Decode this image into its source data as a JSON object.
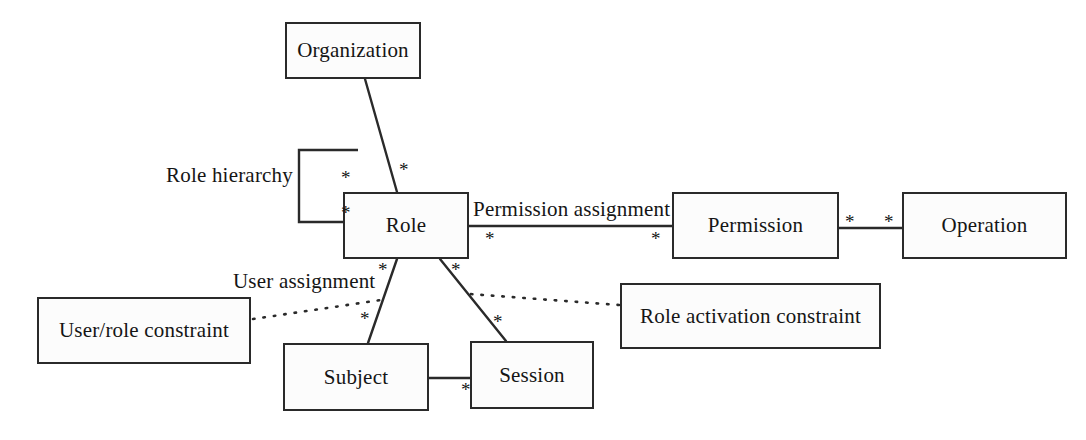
{
  "diagram": {
    "background_color": "#ffffff",
    "stroke_color": "#2a2a2a",
    "text_color": "#151515",
    "box_fill": "#fcfcfc",
    "nodes": [
      {
        "id": "organization",
        "label": "Organization",
        "x": 285,
        "y": 22,
        "w": 136,
        "h": 57
      },
      {
        "id": "role",
        "label": "Role",
        "x": 343,
        "y": 192,
        "w": 126,
        "h": 67
      },
      {
        "id": "permission",
        "label": "Permission",
        "x": 672,
        "y": 192,
        "w": 167,
        "h": 67
      },
      {
        "id": "operation",
        "label": "Operation",
        "x": 902,
        "y": 192,
        "w": 165,
        "h": 67
      },
      {
        "id": "user-role-constraint",
        "label": "User/role constraint",
        "x": 37,
        "y": 297,
        "w": 214,
        "h": 67
      },
      {
        "id": "role-activation-constraint",
        "label": "Role activation constraint",
        "x": 620,
        "y": 283,
        "w": 261,
        "h": 66
      },
      {
        "id": "subject",
        "label": "Subject",
        "x": 283,
        "y": 343,
        "w": 146,
        "h": 68
      },
      {
        "id": "session",
        "label": "Session",
        "x": 470,
        "y": 341,
        "w": 124,
        "h": 68
      }
    ],
    "edge_labels": [
      {
        "id": "role-hierarchy-label",
        "text": "Role hierarchy",
        "x": 166,
        "y": 163
      },
      {
        "id": "permission-assignment-label",
        "text": "Permission assignment",
        "x": 473,
        "y": 197
      },
      {
        "id": "user-assignment-label",
        "text": "User assignment",
        "x": 233,
        "y": 269
      }
    ],
    "multiplicities": [
      {
        "id": "mult-org-role",
        "text": "*",
        "x": 399,
        "y": 160
      },
      {
        "id": "mult-hierarchy-top",
        "text": "*",
        "x": 341,
        "y": 168
      },
      {
        "id": "mult-hierarchy-bottom",
        "text": "*",
        "x": 341,
        "y": 203
      },
      {
        "id": "mult-perm-left",
        "text": "*",
        "x": 485,
        "y": 229
      },
      {
        "id": "mult-perm-right",
        "text": "*",
        "x": 651,
        "y": 229
      },
      {
        "id": "mult-permission-op-left",
        "text": "*",
        "x": 845,
        "y": 212
      },
      {
        "id": "mult-permission-op-right",
        "text": "*",
        "x": 884,
        "y": 212
      },
      {
        "id": "mult-role-subject-top",
        "text": "*",
        "x": 378,
        "y": 260
      },
      {
        "id": "mult-role-subject-bottom",
        "text": "*",
        "x": 360,
        "y": 309
      },
      {
        "id": "mult-role-session-top",
        "text": "*",
        "x": 451,
        "y": 260
      },
      {
        "id": "mult-role-session-bottom",
        "text": "*",
        "x": 493,
        "y": 312
      },
      {
        "id": "mult-subject-session",
        "text": "*",
        "x": 461,
        "y": 380
      }
    ],
    "connectors": [
      {
        "id": "organization-to-role",
        "style": "solid",
        "from": "organization",
        "to": "role"
      },
      {
        "id": "role-self-hierarchy",
        "style": "solid",
        "from": "role",
        "to": "role"
      },
      {
        "id": "role-to-permission",
        "style": "solid",
        "from": "role",
        "to": "permission"
      },
      {
        "id": "permission-to-operation",
        "style": "solid",
        "from": "permission",
        "to": "operation"
      },
      {
        "id": "role-to-subject",
        "style": "solid",
        "from": "role",
        "to": "subject"
      },
      {
        "id": "role-to-session",
        "style": "solid",
        "from": "role",
        "to": "session"
      },
      {
        "id": "subject-to-session",
        "style": "solid",
        "from": "subject",
        "to": "session"
      },
      {
        "id": "user-role-constraint-to-user-assignment",
        "style": "dotted",
        "from": "user-role-constraint",
        "to": "role-to-subject"
      },
      {
        "id": "role-activation-constraint-to-session-edge",
        "style": "dotted",
        "from": "role-activation-constraint",
        "to": "role-to-session"
      }
    ]
  }
}
